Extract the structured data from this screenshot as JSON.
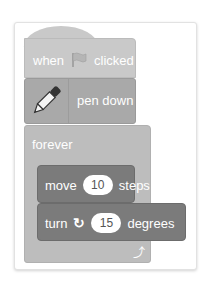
{
  "script": {
    "hat_block": {
      "text_before": "when",
      "icon": "green-flag-icon",
      "text_after": "clicked",
      "color": "#c9c9c9"
    },
    "pen_block": {
      "icon": "pen-icon",
      "label": "pen down",
      "color": "#a9a9a9"
    },
    "forever_block": {
      "label": "forever",
      "return_icon": "loop-arrow-icon",
      "color": "#bdbdbd"
    },
    "move_block": {
      "text_before": "move",
      "value": "10",
      "text_after": "steps",
      "color": "#7b7b7b"
    },
    "turn_block": {
      "text_before": "turn",
      "icon": "rotate-clockwise-icon",
      "icon_glyph": "↻",
      "value": "15",
      "text_after": "degrees",
      "color": "#7b7b7b"
    },
    "return_glyph": "⤴"
  }
}
